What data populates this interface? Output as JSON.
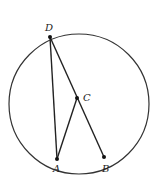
{
  "diagram": {
    "type": "circle-geometry",
    "circle": {
      "cx": 79,
      "cy": 104,
      "r": 70,
      "stroke": "#333333"
    },
    "points": [
      {
        "id": "D",
        "label": "D",
        "x": 50,
        "y": 37,
        "label_x": 45,
        "label_y": 31
      },
      {
        "id": "C",
        "label": "C",
        "x": 77,
        "y": 98,
        "label_x": 83,
        "label_y": 101
      },
      {
        "id": "A",
        "label": "A",
        "x": 57,
        "y": 159,
        "label_x": 53,
        "label_y": 172
      },
      {
        "id": "B",
        "label": "B",
        "x": 104,
        "y": 157,
        "label_x": 102,
        "label_y": 172
      }
    ],
    "segments": [
      {
        "from": "D",
        "to": "A"
      },
      {
        "from": "D",
        "to": "B"
      },
      {
        "from": "A",
        "to": "C"
      }
    ]
  }
}
